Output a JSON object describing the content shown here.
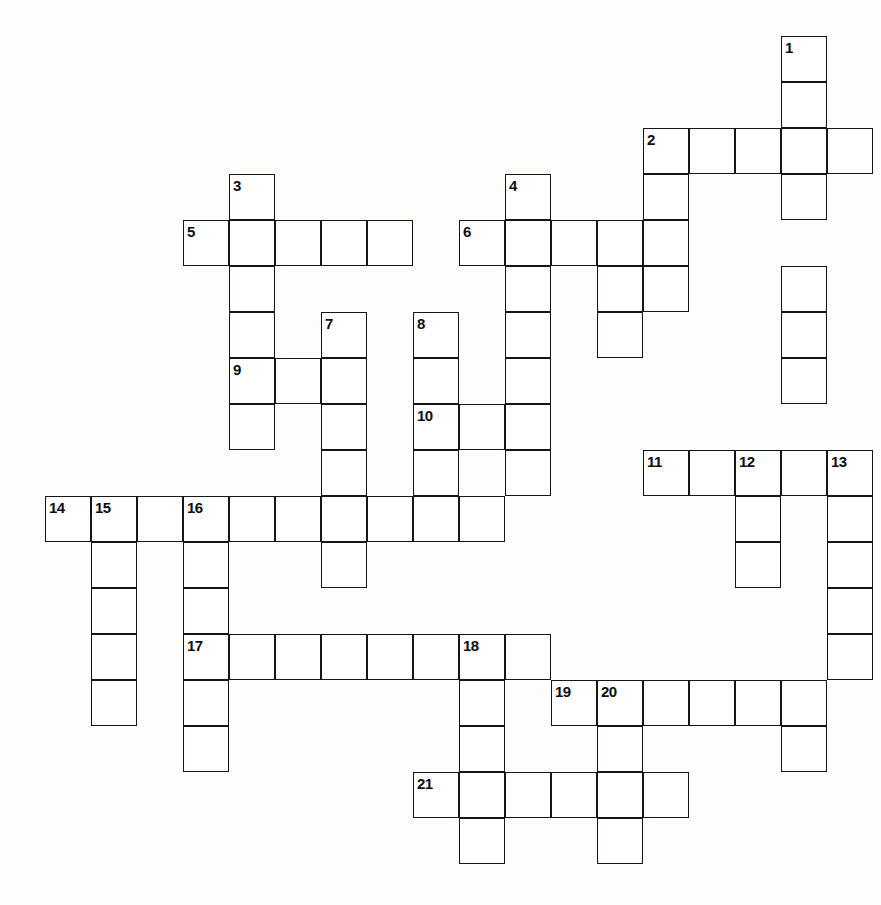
{
  "puzzle": {
    "title": "Crossword Puzzle Grid",
    "cell_size": 46,
    "grid_origin": {
      "x": 45,
      "y": 36
    },
    "colors": {
      "cell_fill": "#ffffff",
      "cell_stroke": "#15161a",
      "background": "#fdfdfc",
      "number_color": "#0d0e12"
    },
    "total_clues": 21,
    "entries": [
      {
        "number": "1",
        "direction": "down",
        "col": 16,
        "row": 0,
        "length": 8
      },
      {
        "number": "2",
        "direction": "across",
        "col": 13,
        "row": 2,
        "length": 5
      },
      {
        "number": "3",
        "direction": "down",
        "col": 4,
        "row": 3,
        "length": 6
      },
      {
        "number": "4",
        "direction": "down",
        "col": 10,
        "row": 3,
        "length": 8
      },
      {
        "number": "5",
        "direction": "across",
        "col": 3,
        "row": 4,
        "length": 5
      },
      {
        "number": "6",
        "direction": "across",
        "col": 9,
        "row": 4,
        "length": 5
      },
      {
        "number": "7",
        "direction": "down",
        "col": 6,
        "row": 6,
        "length": 6
      },
      {
        "number": "8",
        "direction": "down",
        "col": 8,
        "row": 6,
        "length": 6
      },
      {
        "number": "9",
        "direction": "across",
        "col": 4,
        "row": 7,
        "length": 3
      },
      {
        "number": "10",
        "direction": "across",
        "col": 8,
        "row": 8,
        "length": 3
      },
      {
        "number": "11",
        "direction": "across",
        "col": 13,
        "row": 9,
        "length": 5
      },
      {
        "number": "12",
        "direction": "down",
        "col": 15,
        "row": 9,
        "length": 3
      },
      {
        "number": "13",
        "direction": "down",
        "col": 17,
        "row": 9,
        "length": 7
      },
      {
        "number": "14",
        "direction": "across",
        "col": 0,
        "row": 10,
        "length": 10
      },
      {
        "number": "15",
        "direction": "down",
        "col": 1,
        "row": 10,
        "length": 5
      },
      {
        "number": "16",
        "direction": "down",
        "col": 3,
        "row": 10,
        "length": 6
      },
      {
        "number": "17",
        "direction": "across",
        "col": 3,
        "row": 13,
        "length": 8
      },
      {
        "number": "18",
        "direction": "down",
        "col": 9,
        "row": 13,
        "length": 5
      },
      {
        "number": "19",
        "direction": "across",
        "col": 11,
        "row": 14,
        "length": 6
      },
      {
        "number": "20",
        "direction": "down",
        "col": 12,
        "row": 14,
        "length": 4
      },
      {
        "number": "21",
        "direction": "across",
        "col": 8,
        "row": 16,
        "length": 6
      }
    ],
    "cells": [
      {
        "col": 16,
        "row": 0,
        "num": "1"
      },
      {
        "col": 16,
        "row": 1
      },
      {
        "col": 13,
        "row": 2,
        "num": "2"
      },
      {
        "col": 14,
        "row": 2
      },
      {
        "col": 15,
        "row": 2
      },
      {
        "col": 16,
        "row": 2
      },
      {
        "col": 17,
        "row": 2
      },
      {
        "col": 13,
        "row": 3
      },
      {
        "col": 16,
        "row": 3
      },
      {
        "col": 4,
        "row": 3,
        "num": "3"
      },
      {
        "col": 10,
        "row": 3,
        "num": "4"
      },
      {
        "col": 3,
        "row": 4,
        "num": "5"
      },
      {
        "col": 4,
        "row": 4
      },
      {
        "col": 5,
        "row": 4
      },
      {
        "col": 6,
        "row": 4
      },
      {
        "col": 7,
        "row": 4
      },
      {
        "col": 9,
        "row": 4,
        "num": "6"
      },
      {
        "col": 10,
        "row": 4
      },
      {
        "col": 11,
        "row": 4
      },
      {
        "col": 12,
        "row": 4
      },
      {
        "col": 13,
        "row": 4
      },
      {
        "col": 4,
        "row": 5
      },
      {
        "col": 10,
        "row": 5
      },
      {
        "col": 12,
        "row": 5
      },
      {
        "col": 13,
        "row": 5
      },
      {
        "col": 16,
        "row": 5
      },
      {
        "col": 4,
        "row": 6
      },
      {
        "col": 6,
        "row": 6,
        "num": "7"
      },
      {
        "col": 8,
        "row": 6,
        "num": "8"
      },
      {
        "col": 10,
        "row": 6
      },
      {
        "col": 12,
        "row": 6
      },
      {
        "col": 16,
        "row": 6
      },
      {
        "col": 4,
        "row": 7,
        "num": "9"
      },
      {
        "col": 5,
        "row": 7
      },
      {
        "col": 6,
        "row": 7
      },
      {
        "col": 8,
        "row": 7
      },
      {
        "col": 10,
        "row": 7
      },
      {
        "col": 16,
        "row": 7
      },
      {
        "col": 4,
        "row": 8
      },
      {
        "col": 6,
        "row": 8
      },
      {
        "col": 8,
        "row": 8,
        "num": "10"
      },
      {
        "col": 9,
        "row": 8
      },
      {
        "col": 10,
        "row": 8
      },
      {
        "col": 6,
        "row": 9
      },
      {
        "col": 8,
        "row": 9
      },
      {
        "col": 10,
        "row": 9
      },
      {
        "col": 13,
        "row": 9,
        "num": "11"
      },
      {
        "col": 14,
        "row": 9
      },
      {
        "col": 15,
        "row": 9,
        "num": "12"
      },
      {
        "col": 16,
        "row": 9
      },
      {
        "col": 17,
        "row": 9,
        "num": "13"
      },
      {
        "col": 0,
        "row": 10,
        "num": "14"
      },
      {
        "col": 1,
        "row": 10,
        "num": "15"
      },
      {
        "col": 2,
        "row": 10
      },
      {
        "col": 3,
        "row": 10,
        "num": "16"
      },
      {
        "col": 4,
        "row": 10
      },
      {
        "col": 5,
        "row": 10
      },
      {
        "col": 6,
        "row": 10
      },
      {
        "col": 7,
        "row": 10
      },
      {
        "col": 8,
        "row": 10
      },
      {
        "col": 9,
        "row": 10
      },
      {
        "col": 15,
        "row": 10
      },
      {
        "col": 17,
        "row": 10
      },
      {
        "col": 1,
        "row": 11
      },
      {
        "col": 3,
        "row": 11
      },
      {
        "col": 6,
        "row": 11
      },
      {
        "col": 15,
        "row": 11
      },
      {
        "col": 17,
        "row": 11
      },
      {
        "col": 1,
        "row": 12
      },
      {
        "col": 3,
        "row": 12
      },
      {
        "col": 17,
        "row": 12
      },
      {
        "col": 1,
        "row": 13
      },
      {
        "col": 3,
        "row": 13,
        "num": "17"
      },
      {
        "col": 4,
        "row": 13
      },
      {
        "col": 5,
        "row": 13
      },
      {
        "col": 6,
        "row": 13
      },
      {
        "col": 7,
        "row": 13
      },
      {
        "col": 8,
        "row": 13
      },
      {
        "col": 9,
        "row": 13,
        "num": "18"
      },
      {
        "col": 10,
        "row": 13
      },
      {
        "col": 17,
        "row": 13
      },
      {
        "col": 1,
        "row": 14
      },
      {
        "col": 3,
        "row": 14
      },
      {
        "col": 9,
        "row": 14
      },
      {
        "col": 11,
        "row": 14,
        "num": "19"
      },
      {
        "col": 12,
        "row": 14,
        "num": "20"
      },
      {
        "col": 13,
        "row": 14
      },
      {
        "col": 14,
        "row": 14
      },
      {
        "col": 15,
        "row": 14
      },
      {
        "col": 16,
        "row": 14
      },
      {
        "col": 3,
        "row": 15
      },
      {
        "col": 9,
        "row": 15
      },
      {
        "col": 12,
        "row": 15
      },
      {
        "col": 16,
        "row": 15
      },
      {
        "col": 8,
        "row": 16,
        "num": "21"
      },
      {
        "col": 9,
        "row": 16
      },
      {
        "col": 10,
        "row": 16
      },
      {
        "col": 11,
        "row": 16
      },
      {
        "col": 12,
        "row": 16
      },
      {
        "col": 13,
        "row": 16
      },
      {
        "col": 9,
        "row": 17
      },
      {
        "col": 12,
        "row": 17
      }
    ]
  }
}
